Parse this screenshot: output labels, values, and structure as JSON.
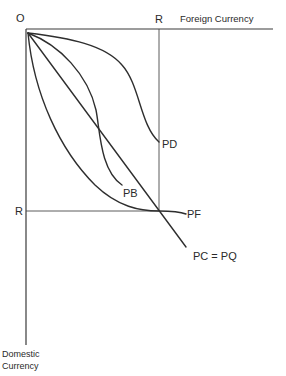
{
  "diagram": {
    "origin_label": "O",
    "x_axis_label": "Foreign Currency",
    "y_axis_label_line1": "Domestic",
    "y_axis_label_line2": "Currency",
    "reserve_label_top": "R",
    "reserve_label_left": "R",
    "curves": [
      {
        "id": "PD",
        "label": "PD"
      },
      {
        "id": "PB",
        "label": "PB"
      },
      {
        "id": "PF",
        "label": "PF"
      },
      {
        "id": "PC_PQ",
        "label": "PC = PQ"
      }
    ],
    "colors": {
      "background": "#ffffff",
      "ink": "#2e2e2e"
    }
  }
}
